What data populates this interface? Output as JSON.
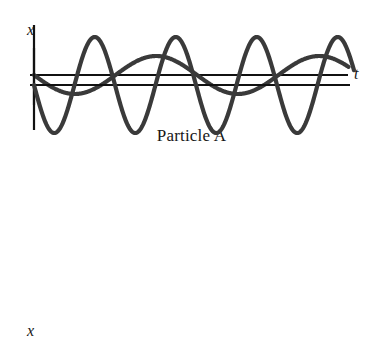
{
  "figure": {
    "background_color": "#ffffff",
    "curve_color": "#3a3a3a",
    "axis_color": "#111111",
    "panels": [
      {
        "id": "particle-a",
        "caption": "Particle A",
        "y_axis_label": "x",
        "x_axis_label": "t"
      },
      {
        "id": "particle-b",
        "caption": "Particle B",
        "y_axis_label": "x",
        "x_axis_label": "t"
      }
    ]
  },
  "chart_data": [
    {
      "type": "line",
      "title": "Particle A",
      "xlabel": "t",
      "ylabel": "x",
      "grid": false,
      "legend": null,
      "waveform": "negative sine",
      "equation": "x(t) = -A sin(2*pi*t/T)",
      "amplitude": 19,
      "period": 163,
      "cycles": 1.93,
      "phase_start": "minimum",
      "axes": {
        "x_axis_y_px": 75,
        "y_axis_x_px": 34,
        "x_axis_start_px": 30,
        "x_axis_end_px": 348,
        "y_axis_top_px": 48,
        "y_axis_bottom_px": 105
      },
      "xlim": [
        0,
        1.93
      ],
      "ylim": [
        -1,
        1
      ],
      "x": [
        0.0,
        0.125,
        0.25,
        0.375,
        0.5,
        0.625,
        0.75,
        0.875,
        1.0,
        1.125,
        1.25,
        1.375,
        1.5,
        1.625,
        1.75,
        1.875,
        1.93
      ],
      "values": [
        -1.0,
        -0.707,
        0.0,
        0.707,
        1.0,
        0.707,
        0.0,
        -0.707,
        -1.0,
        -0.707,
        0.0,
        0.707,
        1.0,
        0.707,
        0.0,
        -0.707,
        -0.88
      ],
      "annotations": [
        "starts at minimum displacement",
        "two crests visible",
        "lower frequency than Particle B"
      ]
    },
    {
      "type": "line",
      "title": "Particle B",
      "xlabel": "t",
      "ylabel": "x",
      "grid": false,
      "legend": null,
      "waveform": "negative sine",
      "equation": "x(t) = -A sin(2*pi*t/T)",
      "amplitude": 48,
      "period": 81,
      "cycles": 3.95,
      "phase_start": "minimum",
      "axes": {
        "x_axis_y_px": 245,
        "y_axis_x_px": 34,
        "x_axis_start_px": 30,
        "x_axis_end_px": 350,
        "y_axis_top_px": 185,
        "y_axis_bottom_px": 290
      },
      "xlim": [
        0,
        3.95
      ],
      "ylim": [
        -1,
        1
      ],
      "x": [
        0.0,
        0.25,
        0.5,
        0.75,
        1.0,
        1.25,
        1.5,
        1.75,
        2.0,
        2.25,
        2.5,
        2.75,
        3.0,
        3.25,
        3.5,
        3.75,
        3.95
      ],
      "values": [
        -1.0,
        0.0,
        1.0,
        0.0,
        -1.0,
        0.0,
        1.0,
        0.0,
        -1.0,
        0.0,
        1.0,
        0.0,
        -1.0,
        0.0,
        1.0,
        0.0,
        -0.95
      ],
      "annotations": [
        "starts at minimum displacement",
        "four crests visible",
        "roughly twice the amplitude and twice the frequency of Particle A"
      ]
    }
  ]
}
